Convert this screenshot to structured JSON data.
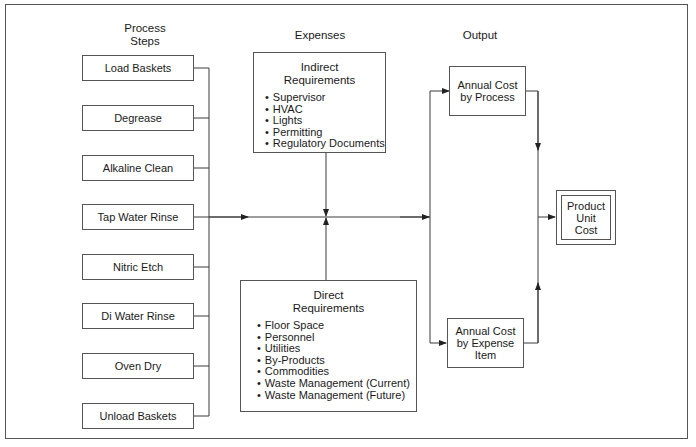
{
  "headings": {
    "process_steps": "Process\nSteps",
    "process_steps_line1": "Process",
    "process_steps_line2": "Steps",
    "expenses": "Expenses",
    "output": "Output"
  },
  "process_steps": [
    "Load Baskets",
    "Degrease",
    "Alkaline Clean",
    "Tap Water Rinse",
    "Nitric Etch",
    "Di Water Rinse",
    "Oven Dry",
    "Unload Baskets"
  ],
  "indirect_requirements": {
    "title_line1": "Indirect",
    "title_line2": "Requirements",
    "items": [
      "Supervisor",
      "HVAC",
      "Lights",
      "Permitting",
      "Regulatory Documents"
    ]
  },
  "direct_requirements": {
    "title_line1": "Direct",
    "title_line2": "Requirements",
    "items": [
      "Floor Space",
      "Personnel",
      "Utilities",
      "By-Products",
      "Commodities",
      "Waste Management (Current)",
      "Waste Management (Future)"
    ]
  },
  "outputs": {
    "annual_cost_by_process_line1": "Annual Cost",
    "annual_cost_by_process_line2": "by Process",
    "annual_cost_by_expense_line1": "Annual Cost",
    "annual_cost_by_expense_line2": "by Expense",
    "annual_cost_by_expense_line3": "Item"
  },
  "result": {
    "line1": "Product",
    "line2": "Unit",
    "line3": "Cost"
  },
  "colors": {
    "line": "#3a3a3a",
    "border": "#555555",
    "background": "#ffffff"
  }
}
